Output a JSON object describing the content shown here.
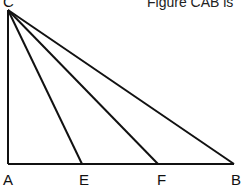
{
  "caption": "Figure CAB is",
  "points": {
    "C": {
      "label": "C",
      "x": 8,
      "y": 10
    },
    "A": {
      "label": "A",
      "x": 8,
      "y": 164
    },
    "E": {
      "label": "E",
      "x": 82,
      "y": 164
    },
    "F": {
      "label": "F",
      "x": 158,
      "y": 164
    },
    "B": {
      "label": "B",
      "x": 234,
      "y": 164
    }
  },
  "segments": [
    "CA",
    "AB",
    "CB",
    "CE",
    "CF"
  ],
  "stroke_color": "#111111"
}
